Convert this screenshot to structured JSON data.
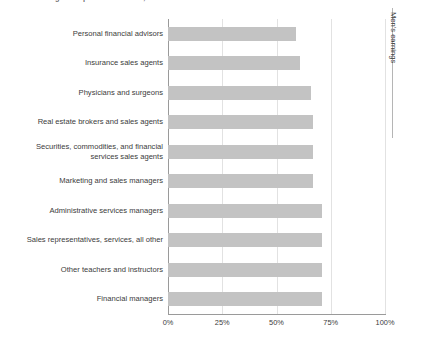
{
  "chart_data": {
    "type": "bar",
    "orientation": "horizontal",
    "title": "Median earnings as a percent of men's, 2014",
    "xlabel": "",
    "ylabel": "",
    "xlim": [
      0,
      100
    ],
    "xticks": [
      "0%",
      "25%",
      "50%",
      "75%",
      "100%"
    ],
    "xtick_values": [
      0,
      25,
      50,
      75,
      100
    ],
    "grid": true,
    "legend_position": "right",
    "legend_label": "Men's earnings",
    "bar_color": "#c3c3c3",
    "categories": [
      "Personal financial advisors",
      "Insurance sales agents",
      "Physicians and surgeons",
      "Real estate brokers and sales agents",
      "Securities, commodities, and financial\nservices sales agents",
      "Marketing and sales managers",
      "Administrative services managers",
      "Sales representatives, services, all other",
      "Other teachers and instructors",
      "Financial managers"
    ],
    "values": [
      59,
      61,
      66,
      67,
      67,
      67,
      71,
      71,
      71,
      71
    ]
  },
  "legend": {
    "label": "Men's earnings"
  },
  "axis": {
    "ticks": [
      "0%",
      "25%",
      "50%",
      "75%",
      "100%"
    ]
  }
}
